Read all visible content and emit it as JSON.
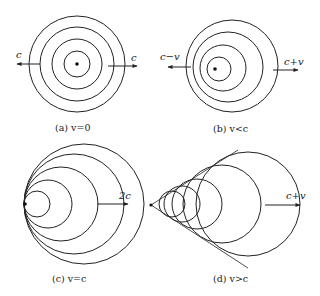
{
  "figure": {
    "panels": [
      {
        "id": "a",
        "caption": "(a) v=0",
        "left_label": "c",
        "right_label": "c",
        "circles": [
          {
            "cx": 77,
            "cy": 64,
            "r": 13
          },
          {
            "cx": 77,
            "cy": 64,
            "r": 25
          },
          {
            "cx": 77,
            "cy": 64,
            "r": 37
          },
          {
            "cx": 77,
            "cy": 64,
            "r": 48
          }
        ],
        "source": {
          "x": 77,
          "y": 64
        }
      },
      {
        "id": "b",
        "caption": "(b) v<c",
        "left_label": "c−v",
        "right_label": "c+v",
        "circles": [
          {
            "cx": 219,
            "cy": 69,
            "r": 12
          },
          {
            "cx": 223,
            "cy": 68,
            "r": 23
          },
          {
            "cx": 228,
            "cy": 67,
            "r": 35
          },
          {
            "cx": 232,
            "cy": 66,
            "r": 46
          }
        ],
        "source": {
          "x": 215,
          "y": 69
        }
      },
      {
        "id": "c",
        "caption": "(c) v=c",
        "right_label": "2c",
        "circles": [
          {
            "cx": 37,
            "cy": 204,
            "r": 13
          },
          {
            "cx": 48,
            "cy": 204,
            "r": 24
          },
          {
            "cx": 61,
            "cy": 204,
            "r": 37
          },
          {
            "cx": 74,
            "cy": 204,
            "r": 50
          },
          {
            "cx": 84,
            "cy": 204,
            "r": 60
          }
        ],
        "source": {
          "x": 25,
          "y": 204
        }
      },
      {
        "id": "d",
        "caption": "(d) v>c",
        "right_label": "c+v",
        "circles": [
          {
            "cx": 172,
            "cy": 204,
            "r": 13
          },
          {
            "cx": 182,
            "cy": 204,
            "r": 18
          },
          {
            "cx": 197,
            "cy": 204,
            "r": 25
          },
          {
            "cx": 222,
            "cy": 204,
            "r": 39
          },
          {
            "cx": 248,
            "cy": 204,
            "r": 52
          }
        ],
        "source": {
          "x": 151,
          "y": 205
        }
      }
    ]
  }
}
